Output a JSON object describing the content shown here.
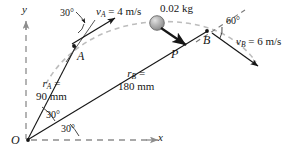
{
  "figure": {
    "type": "mechanics-diagram",
    "colors": {
      "ink": "#161616",
      "trajectory": "#b9b9b9",
      "axis": "#8d8d8d",
      "particle_fill": "#b0b0b0",
      "particle_stroke": "#555555"
    }
  },
  "axes": {
    "y_label": "y",
    "x_label": "x",
    "origin_label": "O"
  },
  "points": {
    "a_label": "A",
    "b_label": "B"
  },
  "vectors": {
    "v_a": {
      "symbol": "v",
      "sub": "A",
      "eq": " = 4 m/s"
    },
    "v_b": {
      "symbol": "v",
      "sub": "B",
      "eq": " = 6 m/s"
    },
    "force_p": "P"
  },
  "mass": {
    "value": "0.02 kg"
  },
  "radii": {
    "r_a": {
      "symbol": "r",
      "sub": "A",
      "eq": " =",
      "value": "90 mm"
    },
    "r_b": {
      "symbol": "r",
      "sub": "B",
      "eq": " =",
      "value": "180 mm"
    }
  },
  "angles": {
    "at_a_velocity": "30°",
    "at_b_velocity": "60°",
    "r_a_from_x": "30°",
    "r_b_from_x": "30°"
  }
}
